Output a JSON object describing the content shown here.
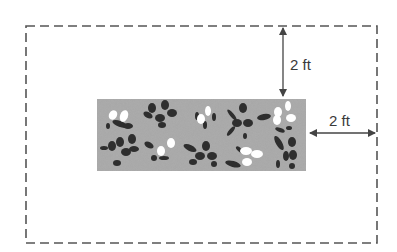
{
  "diagram": {
    "outer_boundary": {
      "style": "dashed",
      "color": "#555555"
    },
    "garden_bed": {
      "fill": "#a6a6a6",
      "plants_dark": "#2e2e2e",
      "flowers_light": "#ffffff"
    },
    "dimensions": [
      {
        "id": "top",
        "label": "2 ft",
        "orientation": "vertical"
      },
      {
        "id": "right",
        "label": "2 ft",
        "orientation": "horizontal"
      }
    ]
  }
}
